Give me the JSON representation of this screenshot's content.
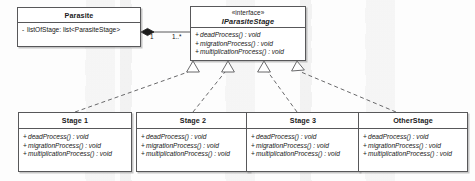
{
  "diagram": {
    "type": "uml-class-diagram",
    "classes": [
      {
        "id": "parasite",
        "name": "Parasite",
        "stereotype": "",
        "attributes": [
          {
            "visibility": "-",
            "text": "listOfStage:  list<ParasiteStage>"
          }
        ],
        "operations": []
      },
      {
        "id": "iparasitestage",
        "name": "IParasiteStage",
        "stereotype": "«interface»",
        "attributes": [],
        "operations": [
          {
            "visibility": "+",
            "text": "deadProcess() : void"
          },
          {
            "visibility": "+",
            "text": "migrationProcess() : void"
          },
          {
            "visibility": "+",
            "text": "multiplicationProcess() : void"
          }
        ]
      },
      {
        "id": "stage1",
        "name": "Stage 1",
        "stereotype": "",
        "attributes": [],
        "operations": [
          {
            "visibility": "+",
            "text": "deadProcess() : void"
          },
          {
            "visibility": "+",
            "text": "migrationProcess() : void"
          },
          {
            "visibility": "+",
            "text": "multiplicationProcess() : void"
          }
        ]
      },
      {
        "id": "stage2",
        "name": "Stage 2",
        "stereotype": "",
        "attributes": [],
        "operations": [
          {
            "visibility": "+",
            "text": "deadProcess() : void"
          },
          {
            "visibility": "+",
            "text": "migrationProcess() : void"
          },
          {
            "visibility": "+",
            "text": "multiplicationProcess() : void"
          }
        ]
      },
      {
        "id": "stage3",
        "name": "Stage 3",
        "stereotype": "",
        "attributes": [],
        "operations": [
          {
            "visibility": "+",
            "text": "deadProcess() : void"
          },
          {
            "visibility": "+",
            "text": "migrationProcess() : void"
          },
          {
            "visibility": "+",
            "text": "multiplicationProcess() : void"
          }
        ]
      },
      {
        "id": "otherstage",
        "name": "OtherStage",
        "stereotype": "",
        "attributes": [],
        "operations": [
          {
            "visibility": "+",
            "text": "deadProcess() : void"
          },
          {
            "visibility": "+",
            "text": "migrationProcess() : void"
          },
          {
            "visibility": "+",
            "text": "multiplicationProcess() : void"
          }
        ]
      }
    ],
    "relationships": [
      {
        "kind": "composition",
        "from": "parasite",
        "to": "iparasitestage",
        "source_multiplicity": "1",
        "target_multiplicity": "1..*"
      },
      {
        "kind": "realization",
        "from": "stage1",
        "to": "iparasitestage"
      },
      {
        "kind": "realization",
        "from": "stage2",
        "to": "iparasitestage"
      },
      {
        "kind": "realization",
        "from": "stage3",
        "to": "iparasitestage"
      },
      {
        "kind": "realization",
        "from": "otherstage",
        "to": "iparasitestage"
      }
    ],
    "colors": {
      "line": "#58585a",
      "box_fill": "#ffffff",
      "text": "#161616",
      "canvas": "#fdfdfd"
    }
  }
}
